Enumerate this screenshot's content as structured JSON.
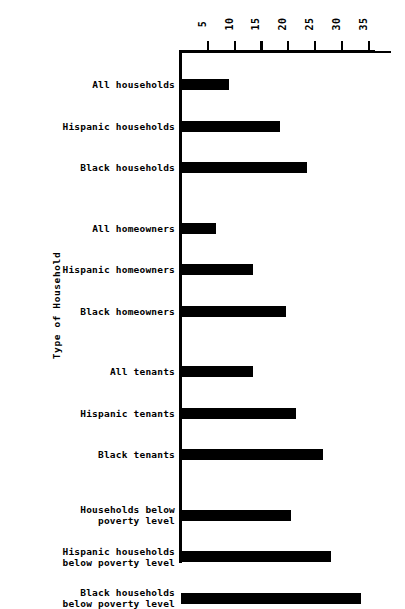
{
  "chart_data": {
    "type": "bar",
    "orientation": "horizontal",
    "title": "",
    "xlabel": "",
    "ylabel": "Type of Household",
    "xlim": [
      0,
      36.5
    ],
    "xticks": [
      5,
      10,
      15,
      20,
      25,
      30,
      35
    ],
    "xtick_labels": [
      "5",
      "10",
      "15",
      "20",
      "25",
      "30",
      "35"
    ],
    "grid": false,
    "legend": null,
    "axis_position": "top",
    "bar_color": "#000000",
    "categories": [
      "All households",
      "Hispanic households",
      "Black households",
      "All homeowners",
      "Hispanic homeowners",
      "Black homeowners",
      "All tenants",
      "Hispanic tenants",
      "Black tenants",
      "Households below\npoverty level",
      "Hispanic households\nbelow poverty level",
      "Black households\nbelow poverty level"
    ],
    "values": [
      9,
      18.5,
      23.5,
      6.5,
      13.5,
      19.5,
      13.5,
      21.5,
      26.5,
      20.5,
      28,
      33.5
    ],
    "groups": [
      {
        "name": "All households",
        "categories": [
          0,
          1,
          2
        ]
      },
      {
        "name": "Homeowners",
        "categories": [
          3,
          4,
          5
        ]
      },
      {
        "name": "Tenants",
        "categories": [
          6,
          7,
          8
        ]
      },
      {
        "name": "Below poverty level",
        "categories": [
          9,
          10,
          11
        ]
      }
    ]
  },
  "axis": {
    "y_title": "Type of Household"
  },
  "caption": {
    "text": ""
  }
}
